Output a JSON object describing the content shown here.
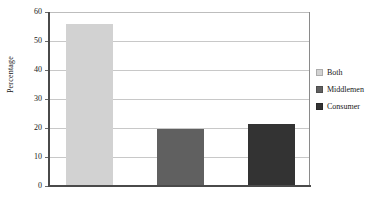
{
  "chart_data": {
    "type": "bar",
    "title": "",
    "xlabel": "",
    "ylabel": "Percentage",
    "ylim": [
      0,
      60
    ],
    "ytick_step": 10,
    "yticks": [
      "60",
      "50",
      "40",
      "30",
      "20",
      "10",
      "0"
    ],
    "grid": true,
    "legend_position": "right",
    "categories": [
      "Both",
      "Middlemen",
      "Consumer"
    ],
    "values": [
      55.5,
      19.3,
      21.0
    ],
    "series": [
      {
        "name": "Both",
        "value": 55.5,
        "color": "#d2d2d2"
      },
      {
        "name": "Middlemen",
        "value": 19.3,
        "color": "#606060"
      },
      {
        "name": "Consumer",
        "value": 21.0,
        "color": "#333333"
      }
    ]
  },
  "legend": {
    "items": [
      {
        "label": "Both",
        "color": "#d2d2d2"
      },
      {
        "label": "Middlemen",
        "color": "#606060"
      },
      {
        "label": "Consumer",
        "color": "#333333"
      }
    ]
  },
  "axis": {
    "y_label": "Percentage"
  }
}
